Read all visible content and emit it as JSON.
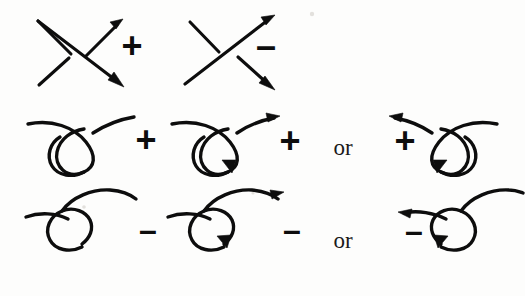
{
  "figure": {
    "background_color": "#fdfdfc",
    "ink_color": "#0d0d0d",
    "or_label": "or",
    "sign_positive": "+",
    "sign_negative": "–"
  },
  "rows": [
    {
      "id": "row-crossings",
      "name": "signed-crossings",
      "cells": [
        {
          "id": "crossing-positive",
          "sign": "+",
          "sign_name": "positive-crossing",
          "over_strand": "northeast-arrow",
          "under_strand": "southeast-arrow",
          "description": "positive crossing"
        },
        {
          "id": "crossing-negative",
          "sign": "–",
          "sign_name": "negative-crossing",
          "over_strand": "northeast-arrow",
          "under_strand": "southeast-arrow",
          "description": "negative crossing"
        }
      ]
    },
    {
      "id": "row-positive-curls",
      "name": "positive-curls",
      "connector": "or",
      "cells": [
        {
          "id": "curl-positive-unoriented",
          "sign": "+",
          "sign_name": "positive-curl",
          "oriented": false,
          "loop_side": "left",
          "description": "positive curl, unoriented"
        },
        {
          "id": "curl-positive-oriented-right",
          "sign": "+",
          "sign_name": "positive-curl-oriented",
          "oriented": true,
          "direction": "rightward",
          "description": "positive curl oriented to the right"
        },
        {
          "id": "curl-positive-oriented-left",
          "sign": "+",
          "sign_name": "positive-curl-oriented-mirror",
          "oriented": true,
          "direction": "leftward",
          "description": "positive curl oriented to the left"
        }
      ]
    },
    {
      "id": "row-negative-curls",
      "name": "negative-curls",
      "connector": "or",
      "cells": [
        {
          "id": "curl-negative-unoriented",
          "sign": "–",
          "sign_name": "negative-curl",
          "oriented": false,
          "loop_side": "left",
          "description": "negative curl, unoriented"
        },
        {
          "id": "curl-negative-oriented-right",
          "sign": "–",
          "sign_name": "negative-curl-oriented",
          "oriented": true,
          "direction": "rightward",
          "description": "negative curl oriented to the right"
        },
        {
          "id": "curl-negative-oriented-left",
          "sign": "–",
          "sign_name": "negative-curl-oriented-mirror",
          "oriented": true,
          "direction": "leftward",
          "description": "negative curl oriented to the left"
        }
      ]
    }
  ]
}
